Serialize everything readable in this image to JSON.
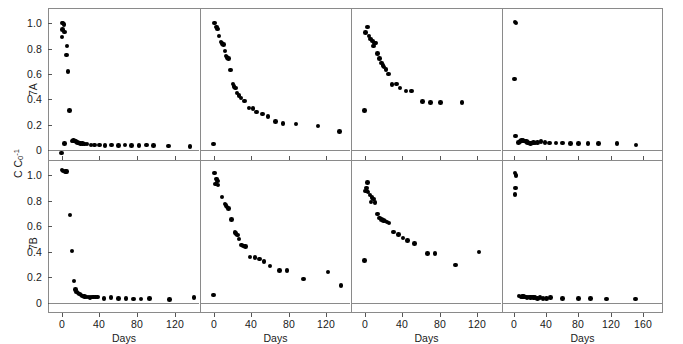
{
  "figure": {
    "yaxis_title_main": "C C",
    "yaxis_title_sub": "0",
    "yaxis_title_sup": "-1",
    "row_labels": [
      "7A",
      "7B"
    ],
    "xaxis_title": "Days",
    "axis_color": "#8a8a8a",
    "marker_color": "#000000"
  },
  "chart_data": {
    "type": "scatter",
    "title": "",
    "xlabel": "Days",
    "ylabel": "C C0^-1",
    "grid": false,
    "legend": null,
    "ylim": [
      -0.08,
      1.12
    ],
    "yticks": [
      0,
      0.2,
      0.4,
      0.6,
      0.8,
      1.0
    ],
    "ytick_labels": [
      "0",
      "0.2",
      "0.4",
      "0.6",
      "0.8",
      "1.0"
    ],
    "panels": [
      {
        "row": "7A",
        "col": 1,
        "xlim": [
          -8,
          140
        ],
        "xticks": [
          0,
          40,
          80,
          120
        ],
        "xtick_labels": [
          "0",
          "40",
          "80",
          "120"
        ],
        "points": [
          [
            0.5,
            1.0
          ],
          [
            1.5,
            1.0
          ],
          [
            2.5,
            0.99
          ],
          [
            1.0,
            0.95
          ],
          [
            3.0,
            0.93
          ],
          [
            0.5,
            0.89
          ],
          [
            6.0,
            0.82
          ],
          [
            5.0,
            0.75
          ],
          [
            7.0,
            0.62
          ],
          [
            8.5,
            0.31
          ],
          [
            3.0,
            0.05
          ],
          [
            11.0,
            0.07
          ],
          [
            12.5,
            0.075
          ],
          [
            14.0,
            0.07
          ],
          [
            15.5,
            0.065
          ],
          [
            17.0,
            0.06
          ],
          [
            18.5,
            0.055
          ],
          [
            20.0,
            0.05
          ],
          [
            22.0,
            0.05
          ],
          [
            24.0,
            0.045
          ],
          [
            27.0,
            0.045
          ],
          [
            31.0,
            0.04
          ],
          [
            35.0,
            0.04
          ],
          [
            40.0,
            0.04
          ],
          [
            46.0,
            0.035
          ],
          [
            53.0,
            0.04
          ],
          [
            60.0,
            0.035
          ],
          [
            67.0,
            0.04
          ],
          [
            74.0,
            0.035
          ],
          [
            82.0,
            0.035
          ],
          [
            90.0,
            0.04
          ],
          [
            97.0,
            0.035
          ],
          [
            113.0,
            0.03
          ],
          [
            136.0,
            0.025
          ],
          [
            0.0,
            -0.025
          ]
        ]
      },
      {
        "row": "7A",
        "col": 2,
        "xlim": [
          -8,
          140
        ],
        "xticks": [
          0,
          40,
          80,
          120
        ],
        "xtick_labels": [
          "0",
          "40",
          "80",
          "120"
        ],
        "points": [
          [
            1.0,
            1.0
          ],
          [
            3.0,
            0.97
          ],
          [
            4.0,
            0.955
          ],
          [
            6.0,
            0.9
          ],
          [
            8.0,
            0.85
          ],
          [
            9.0,
            0.84
          ],
          [
            10.5,
            0.83
          ],
          [
            12.0,
            0.78
          ],
          [
            13.5,
            0.74
          ],
          [
            14.5,
            0.73
          ],
          [
            16.0,
            0.72
          ],
          [
            18.0,
            0.63
          ],
          [
            21.0,
            0.52
          ],
          [
            22.0,
            0.5
          ],
          [
            23.5,
            0.49
          ],
          [
            25.0,
            0.45
          ],
          [
            27.0,
            0.43
          ],
          [
            29.0,
            0.41
          ],
          [
            33.0,
            0.385
          ],
          [
            38.0,
            0.33
          ],
          [
            42.0,
            0.325
          ],
          [
            46.0,
            0.3
          ],
          [
            52.0,
            0.285
          ],
          [
            58.0,
            0.265
          ],
          [
            66.0,
            0.225
          ],
          [
            74.0,
            0.21
          ],
          [
            88.0,
            0.205
          ],
          [
            111.0,
            0.19
          ],
          [
            134.0,
            0.145
          ],
          [
            0.0,
            0.045
          ]
        ]
      },
      {
        "row": "7A",
        "col": 3,
        "xlim": [
          -8,
          140
        ],
        "xticks": [
          0,
          40,
          80,
          120
        ],
        "xtick_labels": [
          "0",
          "40",
          "80",
          "120"
        ],
        "points": [
          [
            3.0,
            0.97
          ],
          [
            1.0,
            0.925
          ],
          [
            5.0,
            0.9
          ],
          [
            6.5,
            0.875
          ],
          [
            8.5,
            0.86
          ],
          [
            10.5,
            0.845
          ],
          [
            12.0,
            0.845
          ],
          [
            9.5,
            0.82
          ],
          [
            14.0,
            0.76
          ],
          [
            16.0,
            0.72
          ],
          [
            18.0,
            0.685
          ],
          [
            19.5,
            0.665
          ],
          [
            21.0,
            0.655
          ],
          [
            23.0,
            0.635
          ],
          [
            25.5,
            0.6
          ],
          [
            29.0,
            0.515
          ],
          [
            34.0,
            0.52
          ],
          [
            38.0,
            0.49
          ],
          [
            44.0,
            0.465
          ],
          [
            50.0,
            0.465
          ],
          [
            62.0,
            0.38
          ],
          [
            70.0,
            0.375
          ],
          [
            81.0,
            0.375
          ],
          [
            104.0,
            0.375
          ],
          [
            0.0,
            0.31
          ]
        ]
      },
      {
        "row": "7A",
        "col": 4,
        "xlim": [
          -8,
          178
        ],
        "xticks": [
          0,
          40,
          80,
          120,
          160
        ],
        "xtick_labels": [
          "0",
          "40",
          "80",
          "120",
          "160"
        ],
        "points": [
          [
            1.0,
            1.01
          ],
          [
            2.0,
            1.0
          ],
          [
            0.0,
            0.56
          ],
          [
            1.5,
            0.11
          ],
          [
            5.0,
            0.06
          ],
          [
            7.0,
            0.065
          ],
          [
            9.0,
            0.075
          ],
          [
            10.5,
            0.075
          ],
          [
            12.0,
            0.07
          ],
          [
            13.5,
            0.07
          ],
          [
            15.0,
            0.065
          ],
          [
            16.5,
            0.06
          ],
          [
            18.0,
            0.055
          ],
          [
            20.0,
            0.05
          ],
          [
            22.0,
            0.055
          ],
          [
            24.0,
            0.06
          ],
          [
            26.0,
            0.055
          ],
          [
            29.0,
            0.06
          ],
          [
            33.0,
            0.065
          ],
          [
            38.0,
            0.06
          ],
          [
            44.0,
            0.055
          ],
          [
            52.0,
            0.055
          ],
          [
            60.0,
            0.055
          ],
          [
            70.0,
            0.05
          ],
          [
            80.0,
            0.05
          ],
          [
            92.0,
            0.05
          ],
          [
            105.0,
            0.05
          ],
          [
            128.0,
            0.05
          ],
          [
            152.0,
            0.04
          ]
        ]
      },
      {
        "row": "7B",
        "col": 1,
        "xlim": [
          -8,
          140
        ],
        "xticks": [
          0,
          40,
          80,
          120
        ],
        "xtick_labels": [
          "0",
          "40",
          "80",
          "120"
        ],
        "points": [
          [
            0.5,
            1.04
          ],
          [
            1.5,
            1.035
          ],
          [
            4.0,
            1.03
          ],
          [
            5.0,
            1.03
          ],
          [
            9.0,
            0.69
          ],
          [
            11.0,
            0.405
          ],
          [
            13.0,
            0.17
          ],
          [
            14.5,
            0.105
          ],
          [
            16.0,
            0.085
          ],
          [
            17.5,
            0.075
          ],
          [
            19.0,
            0.07
          ],
          [
            20.5,
            0.06
          ],
          [
            22.0,
            0.055
          ],
          [
            24.0,
            0.05
          ],
          [
            26.0,
            0.045
          ],
          [
            28.0,
            0.045
          ],
          [
            30.0,
            0.04
          ],
          [
            32.0,
            0.045
          ],
          [
            34.0,
            0.045
          ],
          [
            36.0,
            0.045
          ],
          [
            38.0,
            0.045
          ],
          [
            45.0,
            0.035
          ],
          [
            52.0,
            0.04
          ],
          [
            60.0,
            0.035
          ],
          [
            68.0,
            0.035
          ],
          [
            76.0,
            0.03
          ],
          [
            84.0,
            0.03
          ],
          [
            93.0,
            0.035
          ],
          [
            114.0,
            0.025
          ],
          [
            140.0,
            0.04
          ]
        ]
      },
      {
        "row": "7B",
        "col": 2,
        "xlim": [
          -8,
          140
        ],
        "xticks": [
          0,
          40,
          80,
          120
        ],
        "xtick_labels": [
          "0",
          "40",
          "80",
          "120"
        ],
        "points": [
          [
            1.0,
            1.02
          ],
          [
            3.0,
            0.97
          ],
          [
            4.0,
            0.955
          ],
          [
            2.0,
            0.93
          ],
          [
            5.0,
            0.925
          ],
          [
            9.0,
            0.83
          ],
          [
            12.0,
            0.775
          ],
          [
            13.5,
            0.765
          ],
          [
            14.5,
            0.75
          ],
          [
            16.0,
            0.74
          ],
          [
            19.0,
            0.655
          ],
          [
            23.0,
            0.55
          ],
          [
            24.0,
            0.545
          ],
          [
            25.5,
            0.53
          ],
          [
            27.0,
            0.5
          ],
          [
            30.0,
            0.455
          ],
          [
            32.0,
            0.445
          ],
          [
            34.0,
            0.44
          ],
          [
            39.0,
            0.36
          ],
          [
            44.0,
            0.355
          ],
          [
            49.0,
            0.345
          ],
          [
            54.0,
            0.325
          ],
          [
            60.0,
            0.29
          ],
          [
            70.0,
            0.255
          ],
          [
            78.0,
            0.255
          ],
          [
            96.0,
            0.185
          ],
          [
            122.0,
            0.24
          ],
          [
            136.0,
            0.135
          ],
          [
            0.0,
            0.06
          ]
        ]
      },
      {
        "row": "7B",
        "col": 3,
        "xlim": [
          -8,
          140
        ],
        "xticks": [
          0,
          40,
          80,
          120
        ],
        "xtick_labels": [
          "0",
          "40",
          "80",
          "120"
        ],
        "points": [
          [
            3.0,
            0.945
          ],
          [
            2.0,
            0.9
          ],
          [
            1.0,
            0.875
          ],
          [
            2.5,
            0.875
          ],
          [
            3.5,
            0.87
          ],
          [
            6.0,
            0.845
          ],
          [
            8.0,
            0.825
          ],
          [
            9.5,
            0.815
          ],
          [
            7.0,
            0.79
          ],
          [
            11.0,
            0.785
          ],
          [
            14.0,
            0.695
          ],
          [
            16.0,
            0.665
          ],
          [
            18.0,
            0.655
          ],
          [
            20.0,
            0.645
          ],
          [
            22.0,
            0.64
          ],
          [
            24.0,
            0.635
          ],
          [
            26.0,
            0.625
          ],
          [
            31.0,
            0.555
          ],
          [
            36.0,
            0.535
          ],
          [
            41.0,
            0.51
          ],
          [
            46.0,
            0.49
          ],
          [
            53.0,
            0.465
          ],
          [
            67.0,
            0.385
          ],
          [
            75.0,
            0.385
          ],
          [
            97.0,
            0.295
          ],
          [
            122.0,
            0.4
          ],
          [
            0.0,
            0.33
          ]
        ]
      },
      {
        "row": "7B",
        "col": 4,
        "xlim": [
          -8,
          178
        ],
        "xticks": [
          0,
          40,
          80,
          120,
          160
        ],
        "xtick_labels": [
          "0",
          "40",
          "80",
          "120",
          "160"
        ],
        "points": [
          [
            1.0,
            1.02
          ],
          [
            2.0,
            1.0
          ],
          [
            1.5,
            0.9
          ],
          [
            0.5,
            0.85
          ],
          [
            6.0,
            0.055
          ],
          [
            8.0,
            0.045
          ],
          [
            10.0,
            0.05
          ],
          [
            11.5,
            0.05
          ],
          [
            13.0,
            0.045
          ],
          [
            14.5,
            0.045
          ],
          [
            16.0,
            0.04
          ],
          [
            18.0,
            0.045
          ],
          [
            20.0,
            0.04
          ],
          [
            22.0,
            0.045
          ],
          [
            24.0,
            0.04
          ],
          [
            26.0,
            0.04
          ],
          [
            29.0,
            0.035
          ],
          [
            32.0,
            0.04
          ],
          [
            36.0,
            0.035
          ],
          [
            40.0,
            0.035
          ],
          [
            45.0,
            0.04
          ],
          [
            60.0,
            0.035
          ],
          [
            80.0,
            0.035
          ],
          [
            95.0,
            0.035
          ],
          [
            115.0,
            0.03
          ],
          [
            151.0,
            0.03
          ]
        ]
      }
    ]
  }
}
